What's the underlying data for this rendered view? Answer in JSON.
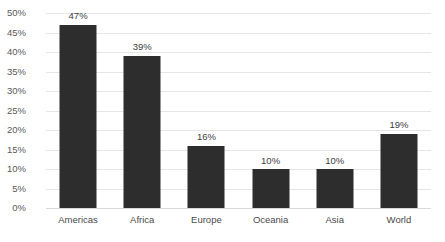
{
  "chart_data": {
    "type": "bar",
    "title": "",
    "xlabel": "",
    "ylabel": "",
    "categories": [
      "Americas",
      "Africa",
      "Europe",
      "Oceania",
      "Asia",
      "World"
    ],
    "values": [
      47,
      39,
      16,
      10,
      10,
      19
    ],
    "value_labels": [
      "47%",
      "39%",
      "16%",
      "10%",
      "10%",
      "19%"
    ],
    "ylim": [
      0,
      50
    ],
    "ytick_values": [
      0,
      5,
      10,
      15,
      20,
      25,
      30,
      35,
      40,
      45,
      50
    ],
    "ytick_labels": [
      "0%",
      "5%",
      "10%",
      "15%",
      "20%",
      "25%",
      "30%",
      "35%",
      "40%",
      "45%",
      "50%"
    ],
    "grid": true,
    "grid_axis": "y",
    "legend": false,
    "legend_position": "none",
    "series": [
      {
        "name": "",
        "values": [
          47,
          39,
          16,
          10,
          10,
          19
        ]
      }
    ],
    "colors": {
      "bar": "#2d2d2d",
      "gridline": "#e6e6e6",
      "baseline": "#d9d9d9",
      "tick_label": "#5a5a5a",
      "value_label": "#3d3d3d",
      "background": "#ffffff"
    }
  }
}
